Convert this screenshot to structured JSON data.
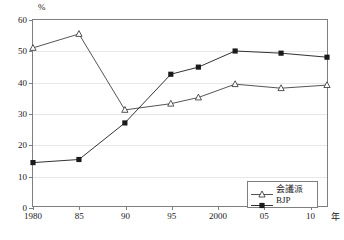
{
  "chart_data": {
    "type": "line",
    "title": "",
    "subtitle": "",
    "xlabel": "年",
    "ylabel": "%",
    "xlim": [
      1980,
      2012
    ],
    "ylim": [
      0,
      60
    ],
    "ytick_labels": [
      "0",
      "10",
      "20",
      "30",
      "40",
      "50",
      "60"
    ],
    "ytick_values": [
      0,
      10,
      20,
      30,
      40,
      50,
      60
    ],
    "xtick_labels": [
      "1980",
      "85",
      "90",
      "95",
      "2000",
      "05",
      "10"
    ],
    "xtick_values": [
      1980,
      1985,
      1990,
      1995,
      2000,
      2005,
      2010
    ],
    "grid": "horizontal",
    "legend_position": "bottom-right",
    "x": [
      1980,
      1985,
      1990,
      1995,
      1998,
      2002,
      2007,
      2012
    ],
    "series": [
      {
        "name": "会議派",
        "marker": "open-triangle",
        "color": "#404040",
        "values": [
          51.0,
          55.5,
          31.0,
          33.0,
          35.0,
          39.3,
          38.0,
          39.0
        ]
      },
      {
        "name": "BJP",
        "marker": "filled-square",
        "color": "#1a1a1a",
        "values": [
          14.0,
          15.0,
          26.8,
          42.5,
          44.8,
          50.0,
          49.3,
          48.0
        ]
      }
    ],
    "annotations": []
  },
  "legend": {
    "items": [
      {
        "label": "会議派"
      },
      {
        "label": "BJP"
      }
    ]
  },
  "axes": {
    "y_unit": "%",
    "x_unit": "年"
  },
  "colors": {
    "frame": "#7f7f7f",
    "grid": "#e8e8e8",
    "text": "#1a1a1a",
    "congress": "#404040",
    "bjp": "#1a1a1a"
  }
}
